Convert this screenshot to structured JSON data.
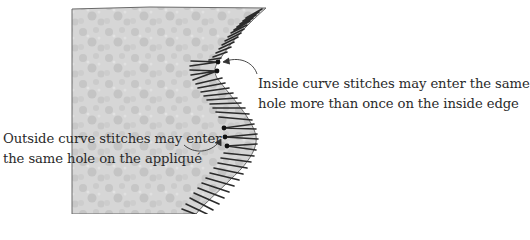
{
  "diagram": {
    "colors": {
      "background": "#ffffff",
      "fabric_fill": "#d4d4d4",
      "fabric_edge": "#6a6a6a",
      "stitch": "#2b2b2b",
      "stitch_hole": "#111111",
      "text": "#2a2a2a"
    },
    "labels": {
      "inside_curve": {
        "line1": "Inside curve stitches may enter the same",
        "line2": "hole more than once on the inside edge"
      },
      "outside_curve": {
        "line1": "Outside curve stitches may enter",
        "line2": "the same hole on the appliqué"
      }
    },
    "callouts": [
      {
        "name": "inside-curve-arrow",
        "points_to": "inside_curve"
      },
      {
        "name": "outside-curve-arrow",
        "points_to": "outside_curve"
      }
    ]
  }
}
